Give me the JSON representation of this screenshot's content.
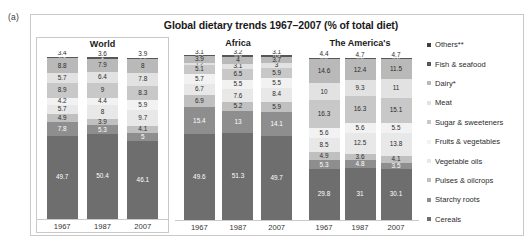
{
  "figure": {
    "label": "(a)",
    "title": "Global dietary trends 1967–2007 (% of total diet)"
  },
  "legend": {
    "position": "right",
    "items": [
      {
        "label": "Others**",
        "color": "#3f3f3f"
      },
      {
        "label": "Fish & seafood",
        "color": "#575757"
      },
      {
        "label": "Dairy*",
        "color": "#b9b9b9"
      },
      {
        "label": "Meat",
        "color": "#e2e2e2"
      },
      {
        "label": "Sugar & sweeteners",
        "color": "#c8c8c8"
      },
      {
        "label": "Fruits & vegetables",
        "color": "#f2f2f2"
      },
      {
        "label": "Vegetable oils",
        "color": "#e8e8e8"
      },
      {
        "label": "Pulses & oilcrops",
        "color": "#c0c0c0"
      },
      {
        "label": "Starchy roots",
        "color": "#8e8e8e"
      },
      {
        "label": "Cereals",
        "color": "#6e6e6e"
      }
    ]
  },
  "panels": [
    {
      "name": "World",
      "years": [
        "1967",
        "1987",
        "2007"
      ],
      "columns": [
        {
          "year": "1967",
          "values": [
            3.4,
            0.9,
            8.8,
            5.7,
            8.9,
            4.2,
            5.7,
            4.9,
            7.8,
            49.7
          ]
        },
        {
          "year": "1987",
          "values": [
            3.6,
            1.0,
            7.9,
            6.4,
            9.0,
            4.4,
            8.0,
            3.9,
            5.3,
            50.4
          ]
        },
        {
          "year": "2007",
          "values": [
            3.9,
            1.1,
            8.0,
            7.8,
            8.3,
            5.9,
            9.7,
            4.1,
            5.0,
            46.1
          ]
        }
      ]
    },
    {
      "name": "Africa",
      "years": [
        "1967",
        "1987",
        "2007"
      ],
      "columns": [
        {
          "year": "1967",
          "values": [
            3.1,
            0.5,
            3.9,
            1.2,
            5.1,
            5.7,
            6.7,
            6.9,
            15.4,
            49.6
          ]
        },
        {
          "year": "1987",
          "values": [
            3.2,
            0.9,
            4.0,
            3.1,
            6.5,
            5.5,
            7.6,
            5.2,
            13.0,
            51.3
          ]
        },
        {
          "year": "2007",
          "values": [
            3.1,
            0.9,
            3.7,
            3.0,
            5.9,
            5.5,
            8.4,
            5.9,
            14.1,
            49.7
          ]
        }
      ]
    },
    {
      "name": "The America's",
      "years": [
        "1967",
        "1987",
        "2007"
      ],
      "columns": [
        {
          "year": "1967",
          "values": [
            4.4,
            0.6,
            14.6,
            10.0,
            16.3,
            5.6,
            8.5,
            4.9,
            5.3,
            29.8
          ]
        },
        {
          "year": "1987",
          "values": [
            4.7,
            0.8,
            12.4,
            9.3,
            16.3,
            5.6,
            12.5,
            3.6,
            4.8,
            31.0
          ]
        },
        {
          "year": "2007",
          "values": [
            4.7,
            0.8,
            11.5,
            11.0,
            15.1,
            5.5,
            13.8,
            4.1,
            3.5,
            30.1
          ]
        }
      ]
    }
  ],
  "chart_data": {
    "type": "bar",
    "title": "Global dietary trends 1967–2007 (% of total diet)",
    "subtitle": "",
    "xlabel": "",
    "ylabel": "% of total diet",
    "ylim": [
      0,
      100
    ],
    "grid": false,
    "stacked": true,
    "orientation": "vertical",
    "legend_position": "right",
    "categories": [
      "1967",
      "1987",
      "2007"
    ],
    "panels": [
      "World",
      "Africa",
      "The America's"
    ],
    "series_order_top_to_bottom": [
      "Others**",
      "Fish & seafood",
      "Dairy*",
      "Meat",
      "Sugar & sweeteners",
      "Fruits & vegetables",
      "Vegetable oils",
      "Pulses & oilcrops",
      "Starchy roots",
      "Cereals"
    ],
    "series": [
      {
        "name": "Others**",
        "World": [
          3.4,
          3.6,
          3.9
        ],
        "Africa": [
          3.1,
          3.2,
          3.1
        ],
        "The America's": [
          4.4,
          4.7,
          4.7
        ]
      },
      {
        "name": "Fish & seafood",
        "World": [
          0.9,
          1.0,
          1.1
        ],
        "Africa": [
          0.5,
          0.9,
          0.9
        ],
        "The America's": [
          0.6,
          0.8,
          0.8
        ]
      },
      {
        "name": "Dairy*",
        "World": [
          8.8,
          7.9,
          8.0
        ],
        "Africa": [
          3.9,
          4.0,
          3.7
        ],
        "The America's": [
          14.6,
          12.4,
          11.5
        ]
      },
      {
        "name": "Meat",
        "World": [
          5.7,
          6.4,
          7.8
        ],
        "Africa": [
          1.2,
          3.1,
          3.0
        ],
        "The America's": [
          10.0,
          9.3,
          11.0
        ]
      },
      {
        "name": "Sugar & sweeteners",
        "World": [
          8.9,
          9.0,
          8.3
        ],
        "Africa": [
          5.1,
          6.5,
          5.9
        ],
        "The America's": [
          16.3,
          16.3,
          15.1
        ]
      },
      {
        "name": "Fruits & vegetables",
        "World": [
          4.2,
          4.4,
          5.9
        ],
        "Africa": [
          5.7,
          5.5,
          5.5
        ],
        "The America's": [
          5.6,
          5.6,
          5.5
        ]
      },
      {
        "name": "Vegetable oils",
        "World": [
          5.7,
          8.0,
          9.7
        ],
        "Africa": [
          6.7,
          7.6,
          8.4
        ],
        "The America's": [
          8.5,
          12.5,
          13.8
        ]
      },
      {
        "name": "Pulses & oilcrops",
        "World": [
          4.9,
          3.9,
          4.1
        ],
        "Africa": [
          6.9,
          5.2,
          5.9
        ],
        "The America's": [
          4.9,
          3.6,
          4.1
        ]
      },
      {
        "name": "Starchy roots",
        "World": [
          7.8,
          5.3,
          5.0
        ],
        "Africa": [
          15.4,
          13.0,
          14.1
        ],
        "The America's": [
          5.3,
          4.8,
          3.5
        ]
      },
      {
        "name": "Cereals",
        "World": [
          49.7,
          50.4,
          46.1
        ],
        "Africa": [
          49.6,
          51.3,
          49.7
        ],
        "The America's": [
          29.8,
          31.0,
          30.1
        ]
      }
    ]
  }
}
